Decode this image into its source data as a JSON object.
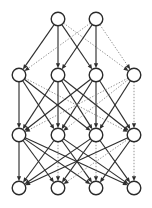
{
  "figure": {
    "title": "",
    "type": "layered-graph-diagram",
    "background_color": "#ffffff",
    "width": 152,
    "height": 208
  },
  "style": {
    "node_fill": "#ffffff",
    "node_stroke": "#2b2b2b",
    "node_radius": 6.8,
    "node_stroke_width": 1.4,
    "edge_solid_color": "#2f2f2f",
    "edge_dotted_color": "#8d8d8d",
    "edge_solid_width": 1.15,
    "edge_dotted_width": 0.95,
    "edge_dash_pattern": "1.4,1.6",
    "arrow_color": "#2f2f2f",
    "arrow_size": 3.4
  },
  "chart_data": {
    "type": "scatter",
    "title": "",
    "xlabel": "",
    "ylabel": "",
    "layers": [
      {
        "id": "L1",
        "name": "top-layer",
        "y": 19,
        "node_count": 2,
        "node_x": [
          58,
          96
        ]
      },
      {
        "id": "L2",
        "name": "upper-middle-layer",
        "y": 75,
        "node_count": 4,
        "node_x": [
          19,
          58,
          96,
          134
        ]
      },
      {
        "id": "L3",
        "name": "lower-middle-layer",
        "y": 135,
        "node_count": 4,
        "node_x": [
          19,
          58,
          96,
          134
        ]
      },
      {
        "id": "L4",
        "name": "bottom-layer",
        "y": 188,
        "node_count": 4,
        "node_x": [
          19,
          58,
          96,
          134
        ]
      }
    ],
    "edges": [
      {
        "from": [
          0,
          0
        ],
        "to": [
          1,
          0
        ],
        "style": "solid"
      },
      {
        "from": [
          0,
          0
        ],
        "to": [
          1,
          1
        ],
        "style": "solid"
      },
      {
        "from": [
          0,
          0
        ],
        "to": [
          1,
          2
        ],
        "style": "solid"
      },
      {
        "from": [
          0,
          0
        ],
        "to": [
          1,
          3
        ],
        "style": "dotted"
      },
      {
        "from": [
          0,
          1
        ],
        "to": [
          1,
          0
        ],
        "style": "dotted"
      },
      {
        "from": [
          0,
          1
        ],
        "to": [
          1,
          1
        ],
        "style": "solid"
      },
      {
        "from": [
          0,
          1
        ],
        "to": [
          1,
          2
        ],
        "style": "solid"
      },
      {
        "from": [
          0,
          1
        ],
        "to": [
          1,
          3
        ],
        "style": "dotted"
      },
      {
        "from": [
          1,
          0
        ],
        "to": [
          2,
          0
        ],
        "style": "solid"
      },
      {
        "from": [
          1,
          0
        ],
        "to": [
          2,
          1
        ],
        "style": "solid"
      },
      {
        "from": [
          1,
          0
        ],
        "to": [
          2,
          2
        ],
        "style": "solid"
      },
      {
        "from": [
          1,
          0
        ],
        "to": [
          2,
          3
        ],
        "style": "dotted"
      },
      {
        "from": [
          1,
          1
        ],
        "to": [
          2,
          0
        ],
        "style": "solid"
      },
      {
        "from": [
          1,
          1
        ],
        "to": [
          2,
          1
        ],
        "style": "solid"
      },
      {
        "from": [
          1,
          1
        ],
        "to": [
          2,
          2
        ],
        "style": "solid"
      },
      {
        "from": [
          1,
          1
        ],
        "to": [
          2,
          3
        ],
        "style": "solid"
      },
      {
        "from": [
          1,
          2
        ],
        "to": [
          2,
          0
        ],
        "style": "solid"
      },
      {
        "from": [
          1,
          2
        ],
        "to": [
          2,
          1
        ],
        "style": "solid"
      },
      {
        "from": [
          1,
          2
        ],
        "to": [
          2,
          2
        ],
        "style": "solid"
      },
      {
        "from": [
          1,
          2
        ],
        "to": [
          2,
          3
        ],
        "style": "solid"
      },
      {
        "from": [
          1,
          3
        ],
        "to": [
          2,
          0
        ],
        "style": "dotted"
      },
      {
        "from": [
          1,
          3
        ],
        "to": [
          2,
          1
        ],
        "style": "dotted"
      },
      {
        "from": [
          1,
          3
        ],
        "to": [
          2,
          2
        ],
        "style": "solid"
      },
      {
        "from": [
          1,
          3
        ],
        "to": [
          2,
          3
        ],
        "style": "dotted"
      },
      {
        "from": [
          2,
          0
        ],
        "to": [
          3,
          0
        ],
        "style": "solid"
      },
      {
        "from": [
          2,
          0
        ],
        "to": [
          3,
          1
        ],
        "style": "solid"
      },
      {
        "from": [
          2,
          0
        ],
        "to": [
          3,
          2
        ],
        "style": "solid"
      },
      {
        "from": [
          2,
          0
        ],
        "to": [
          3,
          3
        ],
        "style": "solid"
      },
      {
        "from": [
          2,
          1
        ],
        "to": [
          3,
          0
        ],
        "style": "solid"
      },
      {
        "from": [
          2,
          1
        ],
        "to": [
          3,
          1
        ],
        "style": "dotted"
      },
      {
        "from": [
          2,
          1
        ],
        "to": [
          3,
          2
        ],
        "style": "solid"
      },
      {
        "from": [
          2,
          1
        ],
        "to": [
          3,
          3
        ],
        "style": "solid"
      },
      {
        "from": [
          2,
          2
        ],
        "to": [
          3,
          0
        ],
        "style": "solid"
      },
      {
        "from": [
          2,
          2
        ],
        "to": [
          3,
          1
        ],
        "style": "solid"
      },
      {
        "from": [
          2,
          2
        ],
        "to": [
          3,
          2
        ],
        "style": "dotted"
      },
      {
        "from": [
          2,
          2
        ],
        "to": [
          3,
          3
        ],
        "style": "solid"
      },
      {
        "from": [
          2,
          3
        ],
        "to": [
          3,
          0
        ],
        "style": "solid"
      },
      {
        "from": [
          2,
          3
        ],
        "to": [
          3,
          1
        ],
        "style": "dotted"
      },
      {
        "from": [
          2,
          3
        ],
        "to": [
          3,
          2
        ],
        "style": "solid"
      },
      {
        "from": [
          2,
          3
        ],
        "to": [
          3,
          3
        ],
        "style": "dotted"
      }
    ],
    "legend": [],
    "grid": false
  }
}
